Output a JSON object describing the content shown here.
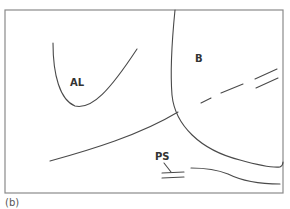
{
  "figure": {
    "caption": "(b)",
    "labels": {
      "al": "AL",
      "b": "B",
      "ps": "PS"
    },
    "colors": {
      "frame": "#8a8a8a",
      "stroke": "#4a4a4a",
      "text": "#333333",
      "background": "#ffffff"
    }
  }
}
